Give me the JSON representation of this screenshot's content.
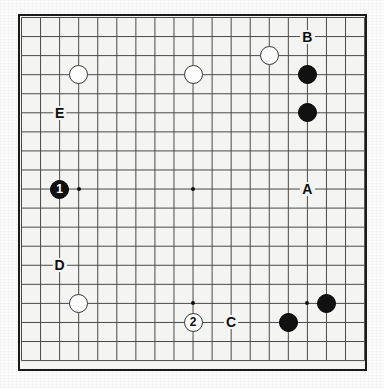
{
  "app": {
    "title": "Go Board Diagram",
    "board_size": 19
  },
  "board": {
    "grid_lines": 19,
    "background_color": "#f4f4f2",
    "line_color": "#4a4a4a",
    "border_color": "#1a1a1a",
    "star_points": [
      {
        "col": 3,
        "row": 3
      },
      {
        "col": 9,
        "row": 3
      },
      {
        "col": 15,
        "row": 3
      },
      {
        "col": 3,
        "row": 9
      },
      {
        "col": 9,
        "row": 9
      },
      {
        "col": 15,
        "row": 9
      },
      {
        "col": 3,
        "row": 15
      },
      {
        "col": 9,
        "row": 15
      },
      {
        "col": 15,
        "row": 15
      }
    ]
  },
  "stones": [
    {
      "id": "white-upper-left",
      "color": "white",
      "col": 3,
      "row": 3,
      "label": ""
    },
    {
      "id": "white-upper-center",
      "color": "white",
      "col": 9,
      "row": 3,
      "label": ""
    },
    {
      "id": "white-upper-right",
      "color": "white",
      "col": 13,
      "row": 2,
      "label": ""
    },
    {
      "id": "black-right-upper",
      "color": "black",
      "col": 15,
      "row": 3,
      "label": ""
    },
    {
      "id": "black-right-lower",
      "color": "black",
      "col": 15,
      "row": 5,
      "label": ""
    },
    {
      "id": "black-move-1",
      "color": "black",
      "col": 2,
      "row": 9,
      "label": "1"
    },
    {
      "id": "white-lower-left",
      "color": "white",
      "col": 3,
      "row": 15,
      "label": ""
    },
    {
      "id": "white-move-2",
      "color": "white",
      "col": 9,
      "row": 16,
      "label": "2"
    },
    {
      "id": "black-lower-right",
      "color": "black",
      "col": 16,
      "row": 15,
      "label": ""
    },
    {
      "id": "black-bottom-right",
      "color": "black",
      "col": 14,
      "row": 16,
      "label": ""
    }
  ],
  "markers": [
    {
      "id": "marker-a",
      "label": "A",
      "col": 15,
      "row": 9
    },
    {
      "id": "marker-b",
      "label": "B",
      "col": 15,
      "row": 1
    },
    {
      "id": "marker-c",
      "label": "C",
      "col": 11,
      "row": 16
    },
    {
      "id": "marker-d",
      "label": "D",
      "col": 2,
      "row": 13
    },
    {
      "id": "marker-e",
      "label": "E",
      "col": 2,
      "row": 5
    }
  ]
}
